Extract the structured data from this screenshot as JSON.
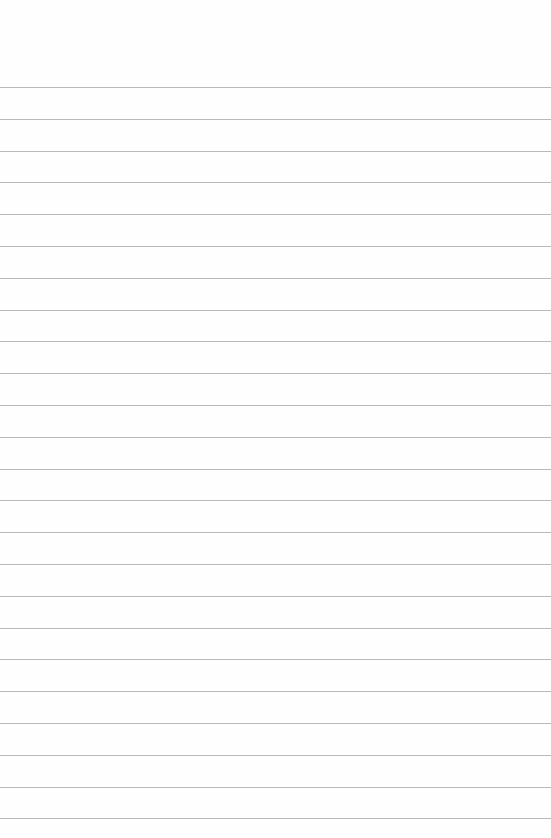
{
  "page": {
    "type": "lined-paper",
    "background_color": "#fefefe",
    "rule_color": "#b9b9b9",
    "rule_count": 24,
    "first_rule_y": 87,
    "rule_spacing": 31.8
  },
  "text_lines": []
}
